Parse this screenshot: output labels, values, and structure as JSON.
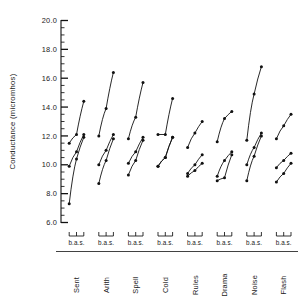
{
  "figure": {
    "name": "conductance-line-chart",
    "background_color": "#ffffff",
    "ink_color": "#111111"
  },
  "axis": {
    "ylabel": "Conductance (micromhos)",
    "ytick_labels": [
      "20.0",
      "18.0",
      "16.0",
      "14.0",
      "12.0",
      "10.0",
      "8.0",
      "6.0"
    ],
    "ytick_values": [
      20.0,
      18.0,
      16.0,
      14.0,
      12.0,
      10.0,
      8.0,
      6.0
    ],
    "minor_tick_step": 0.5,
    "ylim": [
      6.0,
      20.0
    ],
    "grid": "off"
  },
  "groups_axis": {
    "bas_label": "b.a.s.",
    "point_labels": [
      "b",
      "a",
      "s"
    ]
  },
  "chart_data": {
    "type": "line",
    "title": "",
    "xlabel": "",
    "ylabel": "Conductance (micromhos)",
    "ylim": [
      6.0,
      20.0
    ],
    "grid": false,
    "legend": "none",
    "categories": [
      "Sent",
      "Arith",
      "Spell",
      "Cold",
      "Rules",
      "Drama",
      "Noise",
      "Flash"
    ],
    "x": [
      "b",
      "a",
      "s"
    ],
    "groups": [
      {
        "category": "Sent",
        "series": [
          {
            "name": "upper",
            "values": [
              11.5,
              12.1,
              14.4
            ]
          },
          {
            "name": "middle",
            "values": [
              9.9,
              10.9,
              12.1
            ]
          },
          {
            "name": "lower",
            "values": [
              7.3,
              10.4,
              11.9
            ]
          }
        ]
      },
      {
        "category": "Arith",
        "series": [
          {
            "name": "upper",
            "values": [
              12.0,
              13.9,
              16.4
            ]
          },
          {
            "name": "middle",
            "values": [
              10.0,
              11.0,
              12.1
            ]
          },
          {
            "name": "lower",
            "values": [
              8.7,
              10.3,
              11.8
            ]
          }
        ]
      },
      {
        "category": "Spell",
        "series": [
          {
            "name": "upper",
            "values": [
              11.8,
              13.3,
              15.7
            ]
          },
          {
            "name": "middle",
            "values": [
              10.1,
              10.9,
              11.9
            ]
          },
          {
            "name": "lower",
            "values": [
              9.3,
              10.3,
              11.7
            ]
          }
        ]
      },
      {
        "category": "Cold",
        "series": [
          {
            "name": "upper",
            "values": [
              12.1,
              12.1,
              14.6
            ]
          },
          {
            "name": "middle",
            "values": [
              9.9,
              10.5,
              11.9
            ]
          },
          {
            "name": "lower",
            "values": [
              9.9,
              10.5,
              11.9
            ]
          }
        ]
      },
      {
        "category": "Rules",
        "series": [
          {
            "name": "upper",
            "values": [
              11.2,
              12.2,
              13.0
            ]
          },
          {
            "name": "middle",
            "values": [
              9.4,
              10.0,
              10.7
            ]
          },
          {
            "name": "lower",
            "values": [
              9.2,
              9.6,
              10.1
            ]
          }
        ]
      },
      {
        "category": "Drama",
        "series": [
          {
            "name": "upper",
            "values": [
              11.6,
              13.2,
              13.7
            ]
          },
          {
            "name": "middle",
            "values": [
              9.2,
              10.3,
              10.9
            ]
          },
          {
            "name": "lower",
            "values": [
              8.9,
              9.1,
              10.7
            ]
          }
        ]
      },
      {
        "category": "Noise",
        "series": [
          {
            "name": "upper",
            "values": [
              11.7,
              14.9,
              16.8
            ]
          },
          {
            "name": "middle",
            "values": [
              10.0,
              11.2,
              12.2
            ]
          },
          {
            "name": "lower",
            "values": [
              8.9,
              10.6,
              12.0
            ]
          }
        ]
      },
      {
        "category": "Flash",
        "series": [
          {
            "name": "upper",
            "values": [
              11.8,
              12.7,
              13.5
            ]
          },
          {
            "name": "middle",
            "values": [
              9.8,
              10.3,
              10.8
            ]
          },
          {
            "name": "lower",
            "values": [
              8.8,
              9.4,
              10.1
            ]
          }
        ]
      }
    ]
  }
}
